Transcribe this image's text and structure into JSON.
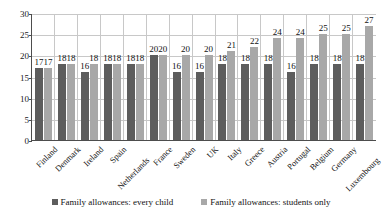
{
  "chart_data": {
    "type": "bar",
    "title": "",
    "xlabel": "",
    "ylabel": "",
    "ylim": [
      0,
      30
    ],
    "yticks": [
      0,
      5,
      10,
      15,
      20,
      25,
      30
    ],
    "grid": true,
    "legend_position": "bottom",
    "categories": [
      "Finland",
      "Denmark",
      "Ireland",
      "Spain",
      "Netherlands",
      "France",
      "Sweden",
      "UK",
      "Italy",
      "Greece",
      "Austria",
      "Portugal",
      "Belgium",
      "Germany",
      "Luxembourg"
    ],
    "series": [
      {
        "name": "Family allowances: every child",
        "color": "#5d5d5d",
        "values": [
          17,
          18,
          16,
          18,
          18,
          20,
          16,
          16,
          18,
          18,
          18,
          16,
          18,
          18,
          18
        ]
      },
      {
        "name": "Family allowances: students only",
        "color": "#a8a8a8",
        "values": [
          17,
          18,
          18,
          18,
          18,
          20,
          20,
          20,
          21,
          22,
          24,
          24,
          25,
          25,
          27
        ]
      }
    ]
  },
  "legend": {
    "items": [
      {
        "label": "Family allowances: every child"
      },
      {
        "label": "Family allowances: students only"
      }
    ]
  }
}
